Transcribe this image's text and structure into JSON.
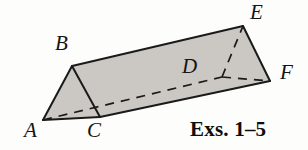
{
  "figure": {
    "kind": "triangular-prism",
    "caption": "Exs. 1–5",
    "fill_color": "#cbc7c3",
    "stroke_color": "#1a1a1a",
    "background_color": "#fdfdfc",
    "vertices": [
      {
        "id": "A",
        "label": "A",
        "x": 43,
        "y": 120,
        "hidden": false
      },
      {
        "id": "B",
        "label": "B",
        "x": 72,
        "y": 66,
        "hidden": false
      },
      {
        "id": "C",
        "label": "C",
        "x": 100,
        "y": 117,
        "hidden": false
      },
      {
        "id": "D",
        "label": "D",
        "x": 222,
        "y": 77,
        "hidden": true
      },
      {
        "id": "E",
        "label": "E",
        "x": 243,
        "y": 26,
        "hidden": false
      },
      {
        "id": "F",
        "label": "F",
        "x": 270,
        "y": 81,
        "hidden": false
      }
    ],
    "edges": [
      {
        "from": "A",
        "to": "B",
        "style": "solid"
      },
      {
        "from": "B",
        "to": "C",
        "style": "solid"
      },
      {
        "from": "A",
        "to": "C",
        "style": "solid"
      },
      {
        "from": "B",
        "to": "E",
        "style": "solid"
      },
      {
        "from": "C",
        "to": "F",
        "style": "solid"
      },
      {
        "from": "E",
        "to": "F",
        "style": "solid"
      },
      {
        "from": "A",
        "to": "D",
        "style": "dashed"
      },
      {
        "from": "D",
        "to": "E",
        "style": "dashed"
      },
      {
        "from": "D",
        "to": "F",
        "style": "dashed"
      }
    ],
    "faces": [
      {
        "name": "front-triangle-ABC",
        "vertices": [
          "A",
          "B",
          "C"
        ]
      },
      {
        "name": "top-rectangle-BCFE",
        "vertices": [
          "B",
          "C",
          "F",
          "E"
        ]
      },
      {
        "name": "right-triangle-DEF",
        "vertices": [
          "D",
          "E",
          "F"
        ]
      }
    ]
  }
}
